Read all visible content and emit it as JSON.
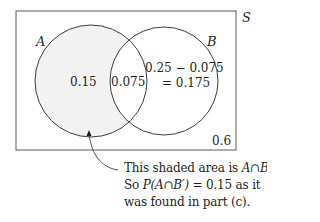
{
  "diagram": {
    "type": "venn",
    "universe_label": "S",
    "sets": [
      {
        "label": "A",
        "region_value": "0.15",
        "shaded": true
      },
      {
        "label": "B",
        "region_value_line1": "0.25 − 0.075",
        "region_value_line2": "= 0.175"
      }
    ],
    "intersection_value": "0.075",
    "outside_value": "0.6",
    "colors": {
      "stroke": "#3c3c3c",
      "shade": "#f2f2f2",
      "text": "#231f20"
    }
  },
  "annotation": {
    "line1_prefix": "This shaded area is ",
    "line1_math": "A∩B′",
    "line1_suffix": ".",
    "line2_prefix": "So ",
    "line2_math": "P(A∩B′)",
    "line2_suffix": " = 0.15 as it",
    "line3": "was found in part (c)."
  }
}
